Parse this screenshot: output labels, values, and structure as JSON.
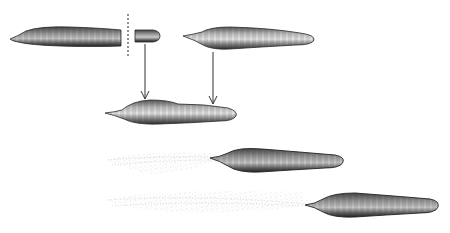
{
  "figure": {
    "colors": {
      "ink": "#2a2a2a",
      "shade_dark": "#3c3c3c",
      "shade_mid": "#8a8a8a",
      "shade_light": "#d6d6d6",
      "stipple": "#9a9a9a",
      "background": "#ffffff"
    },
    "elements": [
      {
        "id": "body-left",
        "label": "left body fragment",
        "x": 10,
        "y": 26,
        "w": 112,
        "h": 20
      },
      {
        "id": "cut-line",
        "label": "dashed cut line",
        "x": 128,
        "y": 14,
        "h": 44
      },
      {
        "id": "small-fragment",
        "label": "small cut fragment",
        "x": 134,
        "y": 30,
        "w": 26,
        "h": 12
      },
      {
        "id": "body-right",
        "label": "right body",
        "x": 183,
        "y": 26,
        "w": 132,
        "h": 24
      },
      {
        "id": "arrow-left",
        "label": "arrow from fragment",
        "x": 145,
        "y1": 44,
        "y2": 100
      },
      {
        "id": "arrow-right",
        "label": "arrow from right body",
        "x": 213,
        "y1": 52,
        "y2": 104
      },
      {
        "id": "body-joined",
        "label": "joined body",
        "x": 105,
        "y": 100,
        "w": 133,
        "h": 26
      },
      {
        "id": "body-trail-1",
        "label": "body with stippled trail",
        "x": 108,
        "y": 146,
        "w": 236,
        "h": 30
      },
      {
        "id": "body-trail-2",
        "label": "body with long stippled trail",
        "x": 105,
        "y": 188,
        "w": 334,
        "h": 28
      }
    ]
  }
}
